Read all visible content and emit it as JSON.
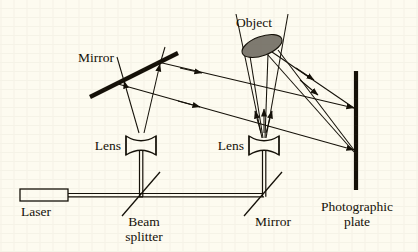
{
  "figure": {
    "type": "optics-ray-diagram",
    "background_color": "#fdfbf0",
    "ink_color": "#141008",
    "object_fill_color": "#7e7a70"
  },
  "labels": {
    "laser": "Laser",
    "beam_splitter_line1": "Beam",
    "beam_splitter_line2": "splitter",
    "mirror_top": "Mirror",
    "mirror_bottom": "Mirror",
    "lens_left": "Lens",
    "lens_right": "Lens",
    "object": "Object",
    "plate_line1": "Photographic",
    "plate_line2": "plate"
  },
  "components": [
    {
      "name": "laser",
      "label": "Laser",
      "shape": "open-rectangle",
      "x": 20,
      "y": 190,
      "width": 48,
      "height": 12
    },
    {
      "name": "beam-splitter",
      "label": "Beam splitter",
      "shape": "diagonal-line",
      "x": 141,
      "y": 196,
      "angle_deg": -55
    },
    {
      "name": "mirror-bottom",
      "label": "Mirror",
      "shape": "diagonal-line",
      "x": 260,
      "y": 196,
      "angle_deg": -55
    },
    {
      "name": "mirror-top",
      "label": "Mirror",
      "shape": "thick-diagonal-bar",
      "x": 133,
      "y": 75,
      "angle_deg": -30
    },
    {
      "name": "lens-left",
      "label": "Lens",
      "shape": "biconcave-lens",
      "x": 141,
      "y": 145
    },
    {
      "name": "lens-right",
      "label": "Lens",
      "shape": "biconcave-lens",
      "x": 264,
      "y": 145
    },
    {
      "name": "object",
      "label": "Object",
      "shape": "filled-ellipse",
      "x": 262,
      "y": 46
    },
    {
      "name": "photographic-plate",
      "label": "Photographic plate",
      "shape": "thick-vertical-bar",
      "x": 355,
      "y": 72,
      "height": 118
    }
  ],
  "beams": [
    {
      "name": "laser-to-splitter",
      "style": "double-line",
      "from": "laser",
      "to": "beam-splitter"
    },
    {
      "name": "splitter-to-mirror-bottom",
      "style": "double-line",
      "from": "beam-splitter",
      "to": "mirror-bottom"
    },
    {
      "name": "splitter-to-lens-left",
      "style": "double-line",
      "from": "beam-splitter",
      "to": "lens-left"
    },
    {
      "name": "mirror-bottom-to-lens-right",
      "style": "double-line",
      "from": "mirror-bottom",
      "to": "lens-right"
    },
    {
      "name": "reference-beam-to-mirror-top",
      "style": "diverging-rays",
      "from": "lens-left",
      "to": "mirror-top",
      "arrows": true
    },
    {
      "name": "reference-beam-to-plate",
      "style": "parallel-rays",
      "from": "mirror-top",
      "to": "photographic-plate",
      "arrows": true
    },
    {
      "name": "object-beam-to-object",
      "style": "diverging-rays",
      "from": "lens-right",
      "to": "object",
      "arrows": true
    },
    {
      "name": "object-scatter-to-plate",
      "style": "converging-rays",
      "from": "object",
      "to": "photographic-plate",
      "arrows": true
    }
  ]
}
